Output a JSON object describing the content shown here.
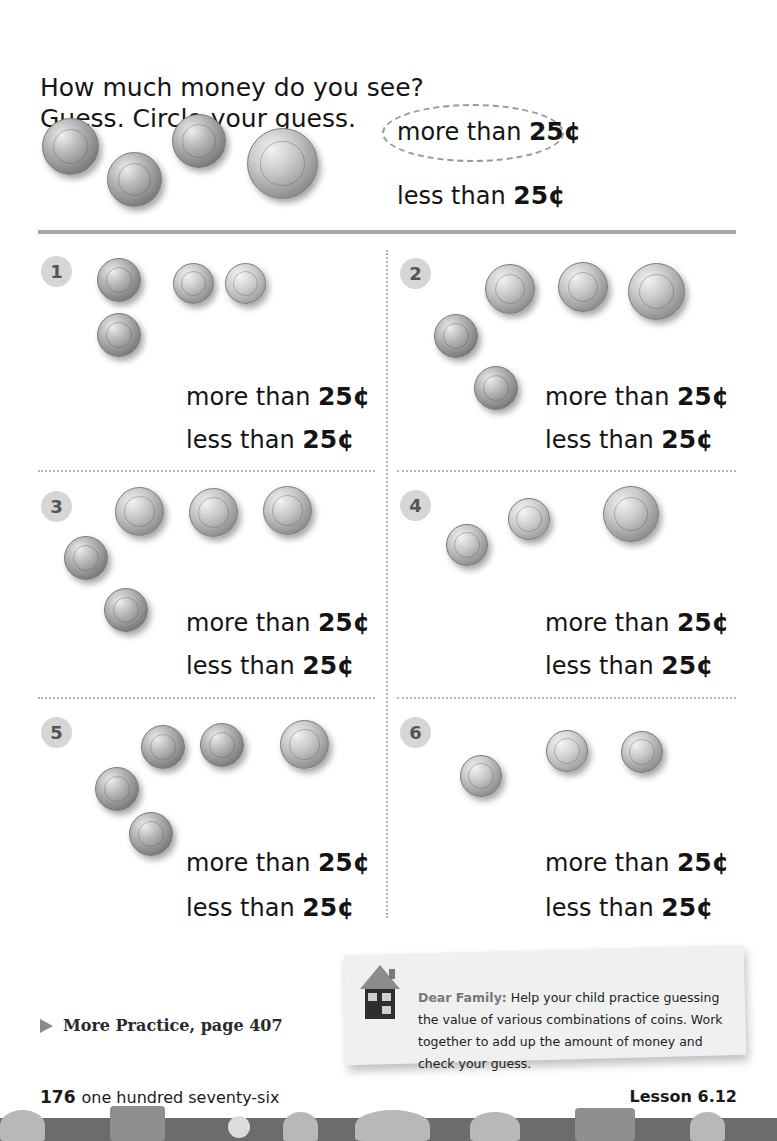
{
  "instructions": {
    "line1": "How much money do you see?",
    "line2": "Guess. Circle your guess."
  },
  "example": {
    "coins": [
      "penny",
      "penny",
      "penny",
      "quarter"
    ],
    "choices": {
      "more_prefix": "more than ",
      "more_amount": "25¢",
      "less_prefix": "less than ",
      "less_amount": "25¢"
    },
    "circled": "more"
  },
  "problems": [
    {
      "number": "1",
      "coins": [
        "penny",
        "penny",
        "dime",
        "dime"
      ],
      "more_prefix": "more than ",
      "more_amount": "25¢",
      "less_prefix": "less than ",
      "less_amount": "25¢"
    },
    {
      "number": "2",
      "coins": [
        "nickel",
        "nickel",
        "quarter",
        "penny",
        "penny"
      ],
      "more_prefix": "more than ",
      "more_amount": "25¢",
      "less_prefix": "less than ",
      "less_amount": "25¢"
    },
    {
      "number": "3",
      "coins": [
        "nickel",
        "nickel",
        "nickel",
        "penny",
        "penny"
      ],
      "more_prefix": "more than ",
      "more_amount": "25¢",
      "less_prefix": "less than ",
      "less_amount": "25¢"
    },
    {
      "number": "4",
      "coins": [
        "dime",
        "dime",
        "quarter"
      ],
      "more_prefix": "more than ",
      "more_amount": "25¢",
      "less_prefix": "less than ",
      "less_amount": "25¢"
    },
    {
      "number": "5",
      "coins": [
        "penny",
        "penny",
        "nickel",
        "penny",
        "penny"
      ],
      "more_prefix": "more than ",
      "more_amount": "25¢",
      "less_prefix": "less than ",
      "less_amount": "25¢"
    },
    {
      "number": "6",
      "coins": [
        "dime",
        "dime",
        "dime"
      ],
      "more_prefix": "more than ",
      "more_amount": "25¢",
      "less_prefix": "less than ",
      "less_amount": "25¢"
    }
  ],
  "more_practice": {
    "icon": "play-triangle-icon",
    "label": "More Practice, page 407"
  },
  "family_note": {
    "icon": "house-icon",
    "lead": "Dear Family:",
    "body": " Help your child practice guessing the value of various combinations of coins. Work together to add up the amount of money and check your guess."
  },
  "footer": {
    "page_number": "176",
    "page_words": "one hundred seventy-six",
    "lesson": "Lesson 6.12"
  }
}
